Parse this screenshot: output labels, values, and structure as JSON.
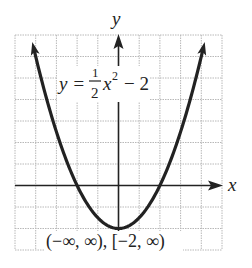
{
  "chart_data": {
    "type": "line",
    "title": "",
    "function": "y = (1/2)x^2 - 2",
    "equation_label": {
      "lhs": "y =",
      "frac_num": "1",
      "frac_den": "2",
      "var": "x",
      "exp": "2",
      "rest": "− 2"
    },
    "xlabel": "x",
    "ylabel": "y",
    "xlim": [
      -5,
      5
    ],
    "ylim": [
      -3,
      7
    ],
    "grid": true,
    "grid_step": 1,
    "vertex": [
      0,
      -2
    ],
    "x_intercepts": [
      -2,
      2
    ],
    "series": [
      {
        "name": "y = 1/2 x^2 - 2",
        "x": [
          -4.24,
          -4,
          -3,
          -2,
          -1,
          0,
          1,
          2,
          3,
          4,
          4.24
        ],
        "y": [
          7,
          6,
          2.5,
          0,
          -1.5,
          -2,
          -1.5,
          0,
          2.5,
          6,
          7
        ]
      }
    ],
    "annotation": "(−∞, ∞), [−2, ∞)",
    "domain_text": "(−∞, ∞)",
    "range_text": "[−2, ∞)"
  },
  "colors": {
    "curve": "#222222",
    "axis": "#222222",
    "grid": "#b8b8b8",
    "background": "#ffffff"
  }
}
